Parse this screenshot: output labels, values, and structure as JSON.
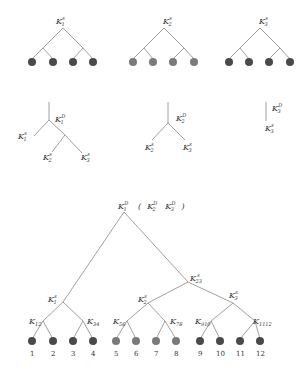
{
  "colors": {
    "dark_node": "#4a4a4a",
    "light_node": "#7a7a7a",
    "edge": "#888888",
    "text": "#333333"
  },
  "top_trees": [
    {
      "root_label": {
        "base": "K",
        "sub": "1",
        "sup": "s"
      },
      "leaf_shade": "dark"
    },
    {
      "root_label": {
        "base": "K",
        "sub": "2",
        "sup": "s"
      },
      "leaf_shade": "light"
    },
    {
      "root_label": {
        "base": "K",
        "sub": "3",
        "sup": "s"
      },
      "leaf_shade": "dark"
    }
  ],
  "middle_trees": [
    {
      "node": {
        "base": "K",
        "sub": "1",
        "sup": "D"
      },
      "leaves": [
        {
          "base": "K",
          "sub": "1",
          "sup": "s"
        },
        {
          "base": "K",
          "sub": "2",
          "sup": "s"
        },
        {
          "base": "K",
          "sub": "3",
          "sup": "s"
        }
      ]
    },
    {
      "node": {
        "base": "K",
        "sub": "2",
        "sup": "D"
      },
      "leaves": [
        {
          "base": "K",
          "sub": "2",
          "sup": "s"
        },
        {
          "base": "K",
          "sub": "3",
          "sup": "s"
        }
      ]
    },
    {
      "node": {
        "base": "K",
        "sub": "3",
        "sup": "D"
      },
      "leaves": [
        {
          "base": "K",
          "sub": "3",
          "sup": "s"
        }
      ]
    }
  ],
  "bottom_tree": {
    "root_label": {
      "base": "K",
      "sub": "1",
      "sup": "D"
    },
    "root_paren": {
      "open": "(",
      "items": [
        {
          "base": "K",
          "sub": "2",
          "sup": "D"
        },
        {
          "base": "K",
          "sub": "3",
          "sup": "D"
        }
      ],
      "close": ")"
    },
    "k23": {
      "base": "K",
      "sub": "23",
      "sup": "s"
    },
    "k1s": {
      "base": "K",
      "sub": "1",
      "sup": "s"
    },
    "k2s": {
      "base": "K",
      "sub": "2",
      "sup": "s"
    },
    "k3s": {
      "base": "K",
      "sub": "3",
      "sup": "s"
    },
    "pairs": [
      {
        "base": "K",
        "sub": "12"
      },
      {
        "base": "K",
        "sub": "34"
      },
      {
        "base": "K",
        "sub": "56"
      },
      {
        "base": "K",
        "sub": "78"
      },
      {
        "base": "K",
        "sub": "910"
      },
      {
        "base": "K",
        "sub": "1112"
      }
    ],
    "leaf_numbers": [
      "1",
      "2",
      "3",
      "4",
      "5",
      "6",
      "7",
      "8",
      "9",
      "10",
      "11",
      "12"
    ]
  }
}
